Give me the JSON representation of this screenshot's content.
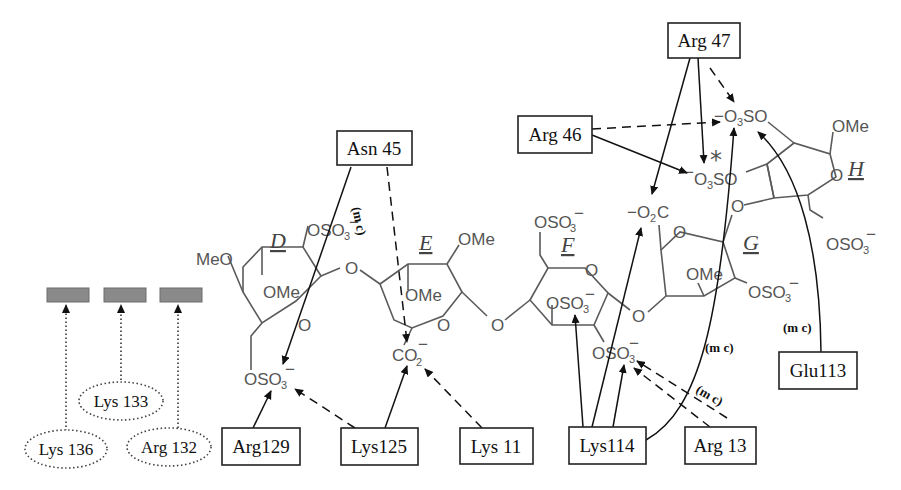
{
  "diagram": {
    "rings": [
      {
        "id": "D",
        "label": "D"
      },
      {
        "id": "E",
        "label": "E"
      },
      {
        "id": "F",
        "label": "F"
      },
      {
        "id": "G",
        "label": "G"
      },
      {
        "id": "H",
        "label": "H"
      }
    ],
    "chem_labels": {
      "meo_d": "MeO",
      "ome_d": "OMe",
      "oso3_d_top": "OSO",
      "oso3_d_bottom": "OSO",
      "o_d_ring": "O",
      "o_de_link": "O",
      "ome_e_top": "OMe",
      "ome_e_ring": "OMe",
      "o_e_ring": "O",
      "co2_e": "CO",
      "o_ef_link": "O",
      "oso3_f_top": "OSO",
      "o_f_ring": "O",
      "oso3_f_mid": "OSO",
      "oso3_f_bottom": "OSO",
      "o_fg_link": "O",
      "o2c_g": "O",
      "o2c_g_c": "C",
      "o_g_ring": "O",
      "ome_g": "OMe",
      "oso3_g": "OSO",
      "o_gh_link": "O",
      "o3so_h_top": "O",
      "o3so_h_top_so": "SO",
      "o3so_h_mid": "O",
      "o3so_h_mid_so": "SO",
      "ome_h": "OMe",
      "o_h_ring": "O",
      "oso3_h_bottom": "OSO",
      "sub3": "3",
      "sub2": "2",
      "minus": "−",
      "star": "*"
    },
    "residues_boxed": [
      {
        "id": "asn45",
        "label": "Asn 45"
      },
      {
        "id": "arg47",
        "label": "Arg 47"
      },
      {
        "id": "arg46",
        "label": "Arg 46"
      },
      {
        "id": "arg129",
        "label": "Arg129"
      },
      {
        "id": "lys125",
        "label": "Lys125"
      },
      {
        "id": "lys11",
        "label": "Lys 11"
      },
      {
        "id": "lys114",
        "label": "Lys114"
      },
      {
        "id": "arg13",
        "label": "Arg 13"
      },
      {
        "id": "glu113",
        "label": "Glu113"
      }
    ],
    "residues_dotted": [
      {
        "id": "lys133",
        "label": "Lys 133"
      },
      {
        "id": "lys136",
        "label": "Lys 136"
      },
      {
        "id": "arg132",
        "label": "Arg 132"
      }
    ],
    "annotations": {
      "mc_asn45": "(m c)",
      "mc_lys114": "(m c)",
      "mc_arg13": "(m c)",
      "mc_glu113": "(m c)"
    },
    "legend": {
      "gray_bar_count": 3
    }
  }
}
